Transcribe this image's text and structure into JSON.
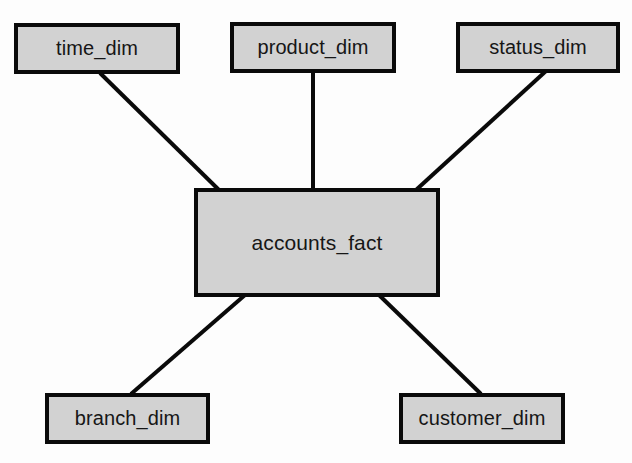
{
  "diagram": {
    "type": "star-schema",
    "canvas": {
      "width": 632,
      "height": 463,
      "background": "#fdfdfd"
    },
    "style": {
      "node_fill": "#d2d2d2",
      "node_border": "#0a0a0a",
      "node_border_width": 4,
      "edge_color": "#0a0a0a",
      "edge_width": 4,
      "text_color": "#161616"
    },
    "fact_table": {
      "id": "accounts_fact",
      "label": "accounts_fact",
      "role": "fact",
      "x": 194,
      "y": 188,
      "width": 246,
      "height": 109
    },
    "dimension_tables": [
      {
        "id": "time_dim",
        "label": "time_dim",
        "role": "dimension",
        "x": 14,
        "y": 23,
        "width": 166,
        "height": 51
      },
      {
        "id": "product_dim",
        "label": "product_dim",
        "role": "dimension",
        "x": 230,
        "y": 22,
        "width": 166,
        "height": 51
      },
      {
        "id": "status_dim",
        "label": "status_dim",
        "role": "dimension",
        "x": 456,
        "y": 22,
        "width": 164,
        "height": 51
      },
      {
        "id": "branch_dim",
        "label": "branch_dim",
        "role": "dimension",
        "x": 45,
        "y": 393,
        "width": 165,
        "height": 51
      },
      {
        "id": "customer_dim",
        "label": "customer_dim",
        "role": "dimension",
        "x": 399,
        "y": 393,
        "width": 166,
        "height": 51
      }
    ],
    "edges": [
      {
        "id": "edge-time-fact",
        "from": "time_dim",
        "to": "accounts_fact",
        "x1": 100,
        "y1": 73,
        "x2": 219,
        "y2": 190
      },
      {
        "id": "edge-product-fact",
        "from": "product_dim",
        "to": "accounts_fact",
        "x1": 313,
        "y1": 71,
        "x2": 313,
        "y2": 190
      },
      {
        "id": "edge-status-fact",
        "from": "status_dim",
        "to": "accounts_fact",
        "x1": 546,
        "y1": 71,
        "x2": 416,
        "y2": 190
      },
      {
        "id": "edge-branch-fact",
        "from": "branch_dim",
        "to": "accounts_fact",
        "x1": 131,
        "y1": 394,
        "x2": 245,
        "y2": 295
      },
      {
        "id": "edge-customer-fact",
        "from": "customer_dim",
        "to": "accounts_fact",
        "x1": 481,
        "y1": 394,
        "x2": 379,
        "y2": 295
      }
    ]
  }
}
